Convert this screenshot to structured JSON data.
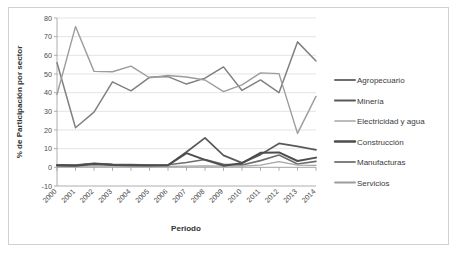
{
  "chart_data": {
    "type": "line",
    "title": "",
    "xlabel": "Periodo",
    "ylabel": "% de Participación por sector",
    "categories": [
      "2000",
      "2001",
      "2002",
      "2003",
      "2004",
      "2005",
      "2006",
      "2007",
      "2008",
      "2009",
      "2010",
      "2011",
      "2012",
      "2013",
      "2014"
    ],
    "x": [
      2000,
      2001,
      2002,
      2003,
      2004,
      2005,
      2006,
      2007,
      2008,
      2009,
      2010,
      2011,
      2012,
      2013,
      2014
    ],
    "ylim": [
      -10,
      80
    ],
    "yticks": [
      -10,
      0,
      10,
      20,
      30,
      40,
      50,
      60,
      70,
      80
    ],
    "grid": true,
    "legend_position": "right",
    "series": [
      {
        "name": "Agropecuario",
        "color": "#6e6e6e",
        "width": 1.6,
        "values": [
          1.4,
          1.2,
          2.2,
          1.6,
          1.5,
          1.2,
          1.4,
          2.6,
          4.2,
          1.6,
          1.3,
          3.6,
          6.6,
          1.8,
          3.2
        ]
      },
      {
        "name": "Minería",
        "color": "#595959",
        "width": 1.7,
        "values": [
          1.2,
          1.0,
          2.0,
          1.4,
          1.3,
          1.1,
          1.2,
          8.2,
          15.8,
          6.4,
          2.4,
          6.8,
          12.8,
          11.2,
          9.4
        ]
      },
      {
        "name": "Electricidad y agua",
        "color": "#a6a6a6",
        "width": 1.3,
        "values": [
          0.6,
          0.5,
          0.8,
          0.6,
          0.5,
          0.5,
          0.5,
          0.6,
          0.8,
          0.7,
          0.7,
          1.2,
          3.0,
          1.2,
          1.0
        ]
      },
      {
        "name": "Construcción",
        "color": "#4d4d4d",
        "width": 2.0,
        "values": [
          1.0,
          0.9,
          1.8,
          1.2,
          1.1,
          1.0,
          1.1,
          7.6,
          4.0,
          0.9,
          2.2,
          7.8,
          8.0,
          3.4,
          5.2
        ]
      },
      {
        "name": "Manufacturas",
        "color": "#808080",
        "width": 1.5,
        "values": [
          56.0,
          21.2,
          29.6,
          45.8,
          41.0,
          48.2,
          48.6,
          44.6,
          47.8,
          53.8,
          41.2,
          46.8,
          40.0,
          67.2,
          57.0
        ]
      },
      {
        "name": "Servicios",
        "color": "#9c9c9c",
        "width": 1.4,
        "values": [
          39.0,
          75.4,
          51.4,
          51.2,
          54.2,
          48.0,
          49.2,
          48.4,
          46.8,
          40.6,
          44.2,
          50.6,
          50.2,
          18.2,
          38.0
        ]
      }
    ]
  },
  "legend": {
    "items": [
      {
        "label": "Agropecuario"
      },
      {
        "label": "Minería"
      },
      {
        "label": "Electricidad y agua"
      },
      {
        "label": "Construcción"
      },
      {
        "label": "Manufacturas"
      },
      {
        "label": "Servicios"
      }
    ]
  }
}
